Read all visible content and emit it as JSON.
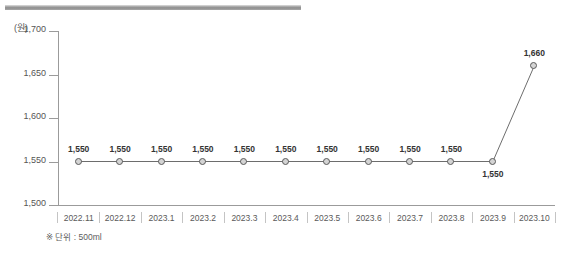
{
  "decoration": {
    "top_rule_color": "#8d8d8d"
  },
  "chart_data": {
    "type": "line",
    "title": "",
    "xlabel": "",
    "ylabel": "(원)",
    "unit_caption": "(원)",
    "categories": [
      "2022.11",
      "2022.12",
      "2023.1",
      "2023.2",
      "2023.3",
      "2023.4",
      "2023.5",
      "2023.6",
      "2023.7",
      "2023.8",
      "2023.9",
      "2023.10"
    ],
    "values": [
      1550,
      1550,
      1550,
      1550,
      1550,
      1550,
      1550,
      1550,
      1550,
      1550,
      1550,
      1660
    ],
    "point_labels": [
      "1,550",
      "1,550",
      "1,550",
      "1,550",
      "1,550",
      "1,550",
      "1,550",
      "1,550",
      "1,550",
      "1,550",
      "1,550",
      "1,660"
    ],
    "label_positions": [
      "above",
      "above",
      "above",
      "above",
      "above",
      "above",
      "above",
      "above",
      "above",
      "above",
      "below",
      "above"
    ],
    "ylim": [
      1500,
      1700
    ],
    "yticks": [
      1700,
      1650,
      1600,
      1550,
      1500
    ],
    "ytick_labels": [
      "1,700",
      "1,650",
      "1,600",
      "1,550",
      "1,500"
    ],
    "grid": false,
    "legend": "none",
    "line_color": "#6d6d6d",
    "marker_fill": "#d4d4d4",
    "marker_stroke": "#5a5a5a",
    "annotation": "※ 단위 : 500ml"
  }
}
